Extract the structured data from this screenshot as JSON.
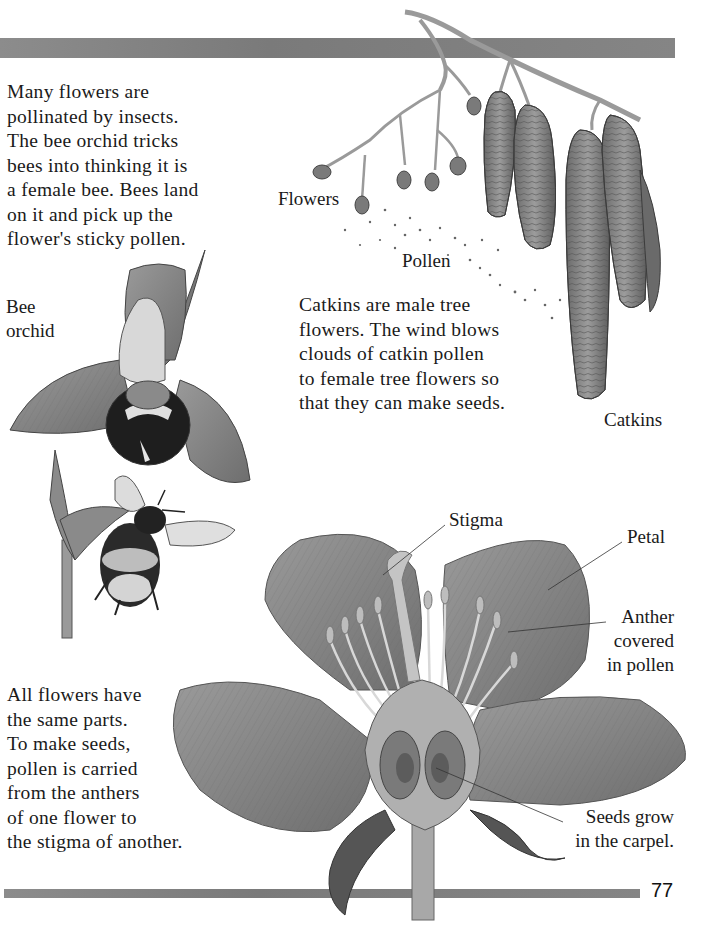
{
  "page": {
    "page_number": "77",
    "colors": {
      "bar": "#808080",
      "text": "#1a1a1a",
      "illustration_dark": "#3a3a3a",
      "illustration_mid": "#8a8a8a",
      "illustration_light": "#c8c8c8"
    }
  },
  "intro": {
    "lines": [
      "Many flowers are",
      "pollinated by insects.",
      "The bee orchid tricks",
      "bees into thinking it is",
      "a female bee. Bees land",
      "on it and pick up the",
      "flower's sticky pollen."
    ]
  },
  "orchid": {
    "label_lines": [
      "Bee",
      "orchid"
    ],
    "icons": [
      "bee-orchid-illustration",
      "bumblebee-illustration"
    ]
  },
  "catkins": {
    "labels": {
      "flowers": "Flowers",
      "pollen": "Pollen",
      "catkins": "Catkins"
    },
    "lines": [
      "Catkins are male tree",
      "flowers. The wind blows",
      "clouds of catkin pollen",
      "to female tree flowers so",
      "that they can make seeds."
    ],
    "icons": [
      "catkin-branch-illustration"
    ]
  },
  "flower_diagram": {
    "labels": {
      "stigma": "Stigma",
      "petal": "Petal",
      "anther": [
        "Anther",
        "covered",
        "in pollen"
      ],
      "seeds": [
        "Seeds grow",
        "in the carpel."
      ]
    },
    "icons": [
      "flower-cross-section-illustration"
    ]
  },
  "outro": {
    "lines": [
      "All flowers have",
      "the same parts.",
      "To make seeds,",
      "pollen is carried",
      "from the anthers",
      "of one flower to",
      "the stigma of another."
    ]
  }
}
